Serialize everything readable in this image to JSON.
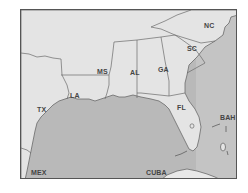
{
  "map": {
    "region": "Southeastern United States and Gulf of Mexico",
    "colors": {
      "land": "#e4e4e4",
      "water": "#b9b9b9",
      "border": "#6a6a6a",
      "frame": "#555555",
      "label": "#444444"
    },
    "labels": {
      "nc": "NC",
      "sc": "SC",
      "ga": "GA",
      "al": "AL",
      "ms": "MS",
      "la": "LA",
      "tx": "TX",
      "fl": "FL",
      "bah": "BAH",
      "mex": "MEX",
      "cuba": "CUBA"
    }
  }
}
